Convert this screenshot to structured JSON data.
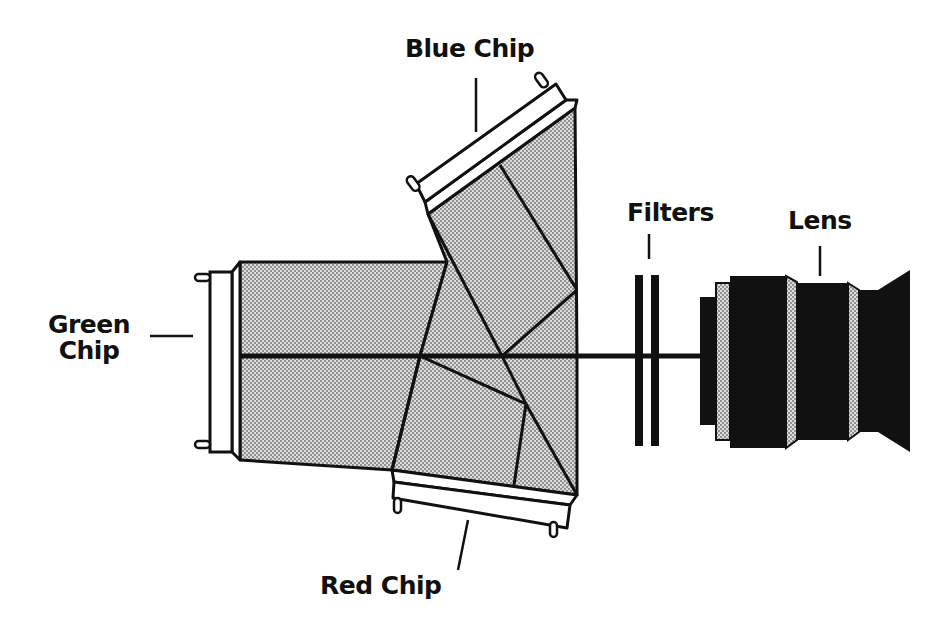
{
  "diagram": {
    "type": "optical-schematic",
    "labels": {
      "blue_chip": "Blue Chip",
      "green_chip_line1": "Green",
      "green_chip_line2": "Chip",
      "red_chip": "Red Chip",
      "filters": "Filters",
      "lens": "Lens"
    },
    "components": [
      {
        "name": "Blue Chip",
        "position": "top, angled sensor on upper prism"
      },
      {
        "name": "Green Chip",
        "position": "left, vertical sensor at end of optical axis"
      },
      {
        "name": "Red Chip",
        "position": "bottom, angled sensor on lower prism"
      },
      {
        "name": "Filters",
        "position": "two vertical plates on optical axis"
      },
      {
        "name": "Lens",
        "position": "right, multi-element lens barrel"
      }
    ],
    "colors": {
      "ink": "#111111",
      "prism_fill": "#d2d2d2",
      "prism_dot": "#7a7a7a",
      "background": "#ffffff"
    }
  }
}
